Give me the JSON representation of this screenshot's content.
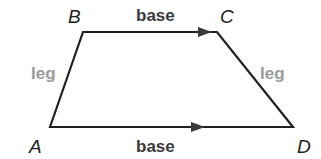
{
  "diagram": {
    "type": "trapezoid",
    "vertices": {
      "A": {
        "label": "A",
        "x": 50,
        "y": 127
      },
      "B": {
        "label": "B",
        "x": 83,
        "y": 32
      },
      "C": {
        "label": "C",
        "x": 217,
        "y": 32
      },
      "D": {
        "label": "D",
        "x": 293,
        "y": 127
      }
    },
    "labels": {
      "top_base": "base",
      "bottom_base": "base",
      "left_leg": "leg",
      "right_leg": "leg"
    },
    "colors": {
      "line": "#231f20",
      "base_text": "#3a3a3a",
      "leg_text": "#9a9a9a",
      "arrow": "#3a3a3a"
    }
  }
}
